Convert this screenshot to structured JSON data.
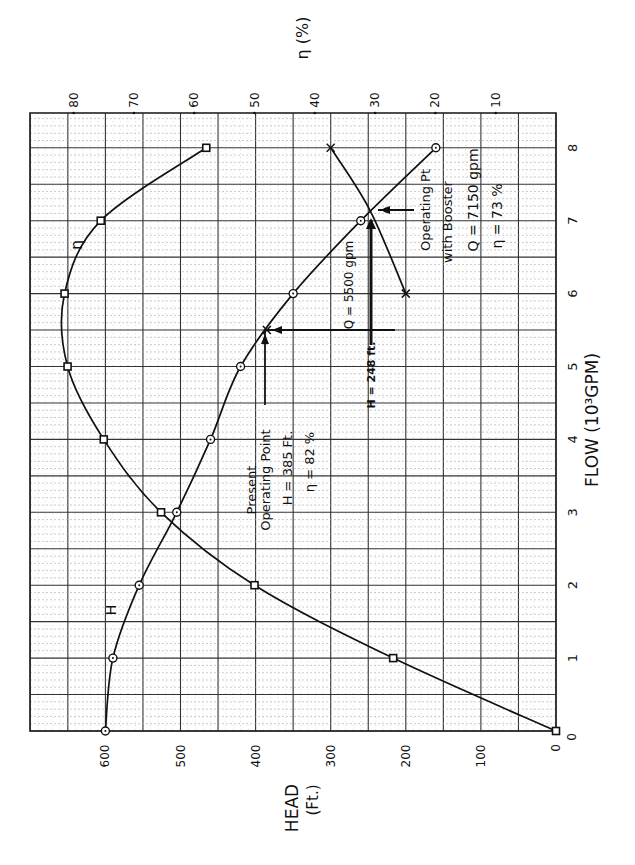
{
  "chart_data": {
    "type": "line",
    "title": "",
    "orientation": "rotated 90 degrees counter-clockwise (landscape chart on portrait page)",
    "xlabel": "FLOW (10³GPM)",
    "ylabel": "HEAD (Ft.)",
    "y2label": "η (%)",
    "x_ticks": [
      "0",
      "1",
      "2",
      "3",
      "4",
      "5",
      "6",
      "7",
      "8"
    ],
    "y_ticks": [
      "0",
      "100",
      "200",
      "300",
      "400",
      "500",
      "600"
    ],
    "y2_ticks": [
      "10",
      "20",
      "30",
      "40",
      "50",
      "60",
      "70",
      "80"
    ],
    "xlim": [
      0,
      8.5
    ],
    "ylim": [
      0,
      700
    ],
    "y2lim": [
      0,
      87
    ],
    "grid": true,
    "x": [
      0,
      1,
      2,
      3,
      4,
      5,
      6,
      7,
      8
    ],
    "series": [
      {
        "name": "H",
        "label": "H",
        "marker": "circle",
        "axis": "head",
        "values": [
          600,
          590,
          555,
          505,
          460,
          420,
          350,
          260,
          160
        ]
      },
      {
        "name": "η",
        "label": "η",
        "marker": "square",
        "axis": "efficiency",
        "values": [
          0,
          27,
          50,
          65.5,
          75,
          81,
          81.5,
          75.5,
          58
        ]
      },
      {
        "name": "Pump with booster (partial)",
        "label": "",
        "marker": "x",
        "axis": "head",
        "x": [
          6,
          7.15,
          8
        ],
        "values": [
          200,
          248,
          300
        ]
      },
      {
        "name": "Operating point marker",
        "marker": "x",
        "axis": "head",
        "x": [
          5.5
        ],
        "values": [
          385
        ]
      }
    ],
    "annotations": [
      {
        "id": "present",
        "lines": [
          "Present",
          "Operating Point",
          "H = 385 Ft.",
          "η = 82 %"
        ],
        "q": 5.5,
        "h": 385
      },
      {
        "id": "q5500",
        "text": "Q = 5500 gpm"
      },
      {
        "id": "h248",
        "text": "H = 248 ft."
      },
      {
        "id": "booster",
        "lines": [
          "Operating Pt",
          "with Booster",
          "Q = 7150 gpm",
          "η = 73 %"
        ],
        "q": 7.15,
        "h": 248
      }
    ]
  },
  "labels": {
    "head_axis_title_1": "HEAD",
    "head_axis_title_2": "(Ft.)",
    "flow_axis_title": "FLOW (10³GPM)",
    "eff_axis_title": "η (%)",
    "curve_h": "H",
    "curve_eta": "η",
    "present_1": "Present",
    "present_2": "Operating Point",
    "present_3": "H = 385 Ft.",
    "present_4": "η = 82 %",
    "q5500": "Q = 5500 gpm",
    "h248": "H = 248 ft.",
    "booster_1": "Operating Pt",
    "booster_2": "with Booster",
    "booster_3": "Q = 7150 gpm",
    "booster_4": "η = 73 %",
    "origin_flow": "0",
    "origin_head": "0"
  }
}
